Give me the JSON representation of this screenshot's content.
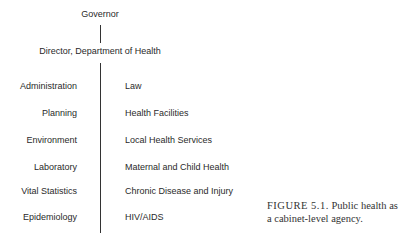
{
  "diagram": {
    "top": "Governor",
    "director": "Director, Department of Health",
    "left_units": [
      "Administration",
      "Planning",
      "Environment",
      "Laboratory",
      "Vital Statistics",
      "Epidemiology"
    ],
    "right_units": [
      "Law",
      "Health Facilities",
      "Local Health Services",
      "Maternal and Child Health",
      "Chronic Disease and Injury",
      "HIV/AIDS"
    ]
  },
  "caption": {
    "label": "FIGURE 5.1.",
    "text": "Public health as a cabinet-level agency."
  }
}
